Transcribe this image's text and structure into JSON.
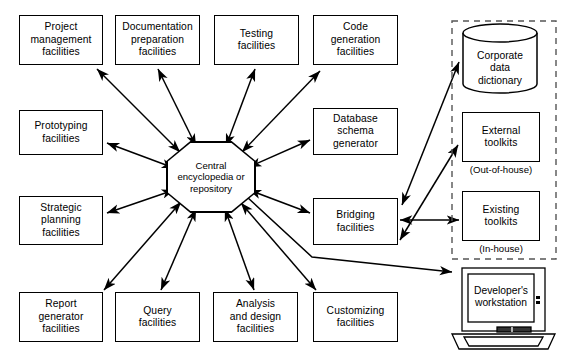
{
  "diagram": {
    "colors": {
      "line": "#000000",
      "background": "#ffffff",
      "boundary": "#555555"
    },
    "center": {
      "id": "central-repository",
      "shape": "octagon",
      "label": "Central\nencyclopedia\nor\nrepository"
    },
    "top_row": [
      {
        "id": "project-management",
        "label": "Project\nmanagement\nfacilities"
      },
      {
        "id": "documentation-preparation",
        "label": "Documentation\npreparation\nfacilities"
      },
      {
        "id": "testing",
        "label": "Testing\nfacilities"
      },
      {
        "id": "code-generation",
        "label": "Code\ngeneration\nfacilities"
      }
    ],
    "left_column": [
      {
        "id": "prototyping",
        "label": "Prototyping\nfacilities"
      },
      {
        "id": "strategic-planning",
        "label": "Strategic\nplanning\nfacilities"
      }
    ],
    "right_column": [
      {
        "id": "database-schema-generator",
        "label": "Database\nschema\ngenerator"
      },
      {
        "id": "bridging",
        "label": "Bridging\nfacilities"
      }
    ],
    "bottom_row": [
      {
        "id": "report-generator",
        "label": "Report\ngenerator\nfacilities"
      },
      {
        "id": "query",
        "label": "Query\nfacilities"
      },
      {
        "id": "analysis-and-design",
        "label": "Analysis\nand design\nfacilities"
      },
      {
        "id": "customizing",
        "label": "Customizing\nfacilities"
      }
    ],
    "external_group": {
      "id": "external-boundary",
      "style": "dashed",
      "items": [
        {
          "id": "corporate-data-dictionary",
          "shape": "cylinder",
          "label": "Corporate\ndata\ndictionary",
          "caption": ""
        },
        {
          "id": "external-toolkits",
          "shape": "rect",
          "label": "External\ntoolkits",
          "caption": "(Out-of-house)"
        },
        {
          "id": "existing-toolkits",
          "shape": "rect",
          "label": "Existing\ntoolkits",
          "caption": "(In-house)"
        }
      ]
    },
    "workstation": {
      "id": "developer-workstation",
      "shape": "laptop",
      "label": "Developer's\nworkstation"
    },
    "connections": [
      {
        "from": "central-repository",
        "to": "project-management",
        "arrows": "both"
      },
      {
        "from": "central-repository",
        "to": "documentation-preparation",
        "arrows": "both"
      },
      {
        "from": "central-repository",
        "to": "testing",
        "arrows": "both"
      },
      {
        "from": "central-repository",
        "to": "code-generation",
        "arrows": "both"
      },
      {
        "from": "central-repository",
        "to": "prototyping",
        "arrows": "both"
      },
      {
        "from": "central-repository",
        "to": "strategic-planning",
        "arrows": "both"
      },
      {
        "from": "central-repository",
        "to": "database-schema-generator",
        "arrows": "both"
      },
      {
        "from": "central-repository",
        "to": "bridging",
        "arrows": "both"
      },
      {
        "from": "central-repository",
        "to": "report-generator",
        "arrows": "both"
      },
      {
        "from": "central-repository",
        "to": "query",
        "arrows": "both"
      },
      {
        "from": "central-repository",
        "to": "analysis-and-design",
        "arrows": "both"
      },
      {
        "from": "central-repository",
        "to": "customizing",
        "arrows": "both"
      },
      {
        "from": "bridging",
        "to": "corporate-data-dictionary",
        "arrows": "both"
      },
      {
        "from": "bridging",
        "to": "external-toolkits",
        "arrows": "both"
      },
      {
        "from": "bridging",
        "to": "existing-toolkits",
        "arrows": "both"
      },
      {
        "from": "central-repository",
        "to": "developer-workstation",
        "arrows": "single"
      }
    ]
  }
}
